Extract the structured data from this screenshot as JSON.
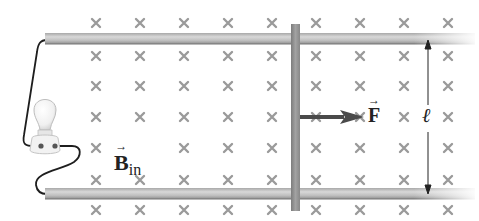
{
  "diagram": {
    "field_label": {
      "symbol": "B",
      "subscript": "in"
    },
    "force_label": {
      "symbol": "F"
    },
    "length_label": "ℓ",
    "field_marker": "×",
    "colors": {
      "rail": "#b8b8b8",
      "bar": "#8c8c8c",
      "marker": "#9a9a9a",
      "arrow": "#4a4a4a",
      "wire": "#1e1e1e"
    },
    "grid": {
      "columns_x": [
        96,
        140,
        184,
        228,
        272,
        316,
        360,
        404,
        448
      ],
      "rows_y": [
        23,
        56,
        86,
        117,
        148,
        180,
        210
      ]
    }
  }
}
